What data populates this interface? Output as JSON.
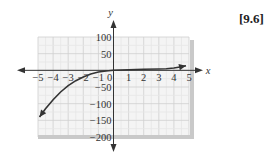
{
  "label": "[9.6]",
  "chart_data": {
    "type": "line",
    "title": "",
    "xlabel": "x",
    "ylabel": "y",
    "xlim": [
      -5,
      5
    ],
    "ylim": [
      -200,
      100
    ],
    "x_ticks": [
      -5,
      -4,
      -3,
      -2,
      -1,
      0,
      1,
      2,
      3,
      4,
      5
    ],
    "y_ticks": [
      100,
      50,
      -50,
      -100,
      -150,
      -200
    ],
    "grid": true,
    "series": [
      {
        "name": "curve",
        "x": [
          -4.9,
          -4.5,
          -4,
          -3.5,
          -3,
          -2.5,
          -2,
          -1.5,
          -1,
          -0.5,
          0,
          1,
          2,
          3,
          3.5,
          4,
          4.5,
          4.8
        ],
        "y": [
          -140,
          -115,
          -88,
          -65,
          -46,
          -31,
          -20,
          -11,
          -5,
          -2,
          0,
          2,
          3,
          4,
          5,
          7,
          11,
          14
        ],
        "arrows": "both"
      }
    ]
  }
}
